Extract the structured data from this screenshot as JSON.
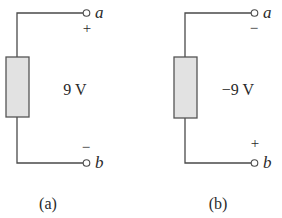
{
  "diagram": {
    "type": "circuit",
    "colors": {
      "wire": "#4a4a4a",
      "element_fill": "#e2e2e2",
      "element_stroke": "#555555",
      "text": "#2a2a2a",
      "background": "#ffffff"
    },
    "panels": [
      {
        "id": "a",
        "caption": "(a)",
        "voltage_label": "9 V",
        "top_terminal": {
          "name": "a",
          "polarity": "+"
        },
        "bottom_terminal": {
          "name": "b",
          "polarity": "−"
        }
      },
      {
        "id": "b",
        "caption": "(b)",
        "voltage_label": "−9 V",
        "top_terminal": {
          "name": "a",
          "polarity": "−"
        },
        "bottom_terminal": {
          "name": "b",
          "polarity": "+"
        }
      }
    ]
  }
}
